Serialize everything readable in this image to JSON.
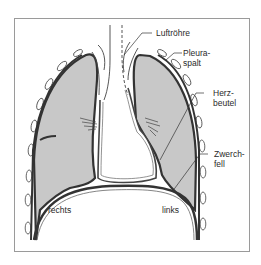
{
  "diagram": {
    "labels": {
      "trachea": "Luftröhre",
      "pleura_1": "Pleura-",
      "pleura_2": "spalt",
      "heart_1": "Herz-",
      "heart_2": "beutel",
      "diaphragm_1": "Zwerch-",
      "diaphragm_2": "fell",
      "right": "rechts",
      "left": "links"
    },
    "colors": {
      "lung_fill": "#c8c8c8",
      "outline": "#333333",
      "frame": "#9a9a9a"
    }
  }
}
